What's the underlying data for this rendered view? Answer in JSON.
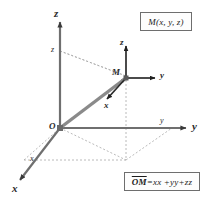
{
  "figure": {
    "title_box": {
      "text": "M(x, y, z)"
    },
    "equation_box": {
      "vector": "OM",
      "rhs": "=xx +yy+zz",
      "full_text": "OM=xx +yy+zz"
    },
    "origin_label": "O",
    "point_label": "M",
    "global_axes": [
      {
        "name": "z-axis",
        "label": "z",
        "direction": "up"
      },
      {
        "name": "y-axis",
        "label": "y",
        "direction": "right"
      },
      {
        "name": "x-axis",
        "label": "x",
        "direction": "down-left"
      }
    ],
    "tick_labels": [
      {
        "name": "z-coordinate-tick",
        "label": "z"
      },
      {
        "name": "y-coordinate-tick",
        "label": "y"
      },
      {
        "name": "x-coordinate-tick",
        "label": "x"
      }
    ],
    "local_frame_axes": [
      {
        "name": "local-z-unit-vector",
        "label": "z",
        "direction": "up"
      },
      {
        "name": "local-y-unit-vector",
        "label": "y",
        "direction": "right"
      },
      {
        "name": "local-x-unit-vector",
        "label": "x",
        "direction": "down-left"
      }
    ],
    "colors": {
      "axis": "#6f6f6f",
      "vector": "#8a8a8a",
      "local_axis": "#2b2b2b",
      "dashed": "#a8a8a8",
      "text": "#1c1c1c",
      "box_border": "#6e6e6e",
      "background": "#ffffff"
    }
  }
}
